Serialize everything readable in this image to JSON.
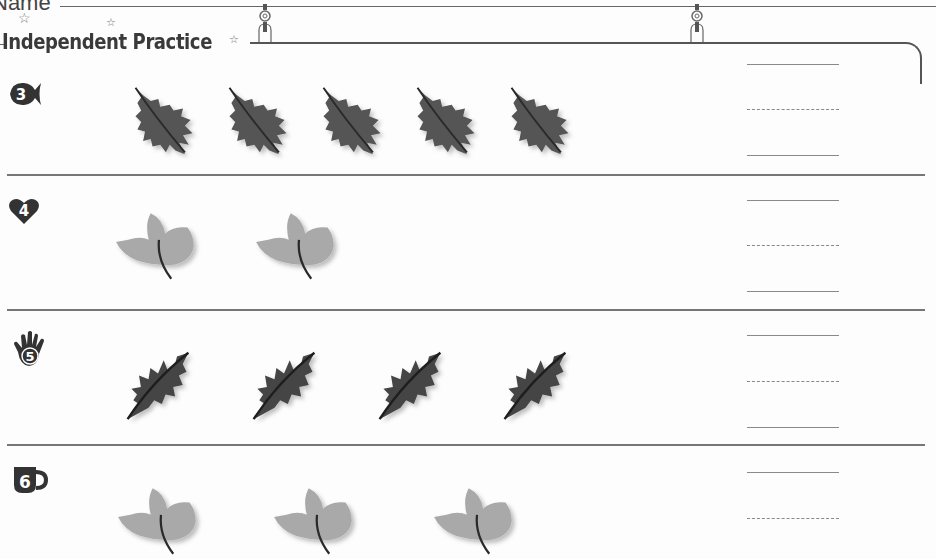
{
  "header": {
    "name_label": "Name",
    "section_title": "Independent Practice"
  },
  "colors": {
    "dark_leaf": "#4a4a4a",
    "light_leaf": "#a8a8a8",
    "rule": "#777777",
    "badge": "#333333"
  },
  "problems": [
    {
      "number": "3",
      "badge_icon": "fish-icon",
      "leaf_type": "oak-leaf-dark",
      "leaf_count": 5,
      "answer_lines": 3
    },
    {
      "number": "4",
      "badge_icon": "heart-icon",
      "leaf_type": "maple-leaf-light",
      "leaf_count": 2,
      "answer_lines": 3
    },
    {
      "number": "5",
      "badge_icon": "hand-icon",
      "leaf_type": "oak-leaf-dark-tilted",
      "leaf_count": 4,
      "answer_lines": 3
    },
    {
      "number": "6",
      "badge_icon": "mug-icon",
      "leaf_type": "maple-leaf-light",
      "leaf_count": 3,
      "answer_lines": 2
    }
  ]
}
